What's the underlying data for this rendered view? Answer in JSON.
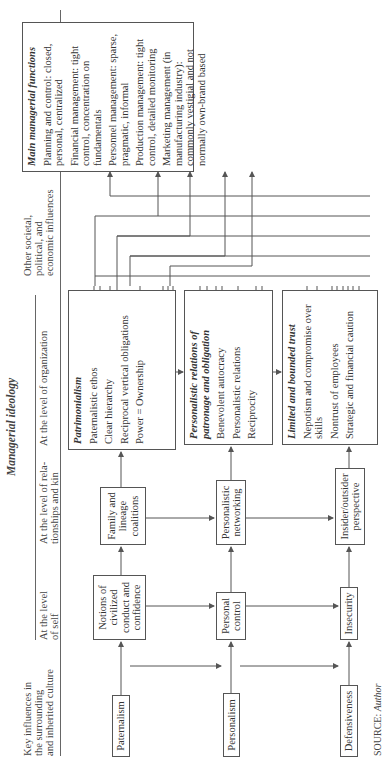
{
  "headers": {
    "key_influences": [
      "Key influences in",
      "the surrounding",
      "and inherited culture"
    ],
    "managerial_ideology": "Managerial ideology",
    "level_self": [
      "At the level",
      "of self"
    ],
    "level_relationships": [
      "At the level of rela-",
      "tionships and kin"
    ],
    "level_organization": "At the level of organization",
    "other_influences": [
      "Other societal,",
      "political, and",
      "economic influences"
    ],
    "outcomes": [
      "Organizational outcomes:",
      "managerial functions"
    ]
  },
  "rows": [
    {
      "culture": "Paternalism",
      "self": "Notions of civilized conduct and confidence",
      "relationships": "Family and lineage coalitions",
      "organization": {
        "title": "Patrimonialism",
        "items": [
          "Paternalistic ethos",
          "Clear hierarchy",
          "Reciprocal vertical obligations",
          "Power = Ownership"
        ]
      }
    },
    {
      "culture": "Personalism",
      "self": "Personal control",
      "relationships": "Personalistic networking",
      "organization": {
        "title": "Personalistic relations of patronage and obligation",
        "items": [
          "Benevolent autocracy",
          "Personalistic relations",
          "Reciprocity"
        ]
      }
    },
    {
      "culture": "Defensiveness",
      "self": "Insecurity",
      "relationships": "Insider/outsider perspective",
      "organization": {
        "title": "Limited and bounded trust",
        "items": [
          "Nepotism and compromise over skills",
          "Nontrust of employees",
          "Strategic and financial caution"
        ]
      }
    }
  ],
  "functions": {
    "title": "Main managerial functions",
    "items": [
      "Planning and control: closed, personal, centralized",
      "Financial management: tight control, concentration on fundamentals",
      "Personnel management: sparse, pragmatic, informal",
      "Production management: tight control, detailed monitoring",
      "Marketing management (in manufacturing industry): commonly vestigial and not normally own-brand based"
    ]
  },
  "source": {
    "label": "SOURCE:",
    "value": "Author"
  },
  "colors": {
    "line": "#555555",
    "text": "#333333",
    "background": "#ffffff"
  }
}
